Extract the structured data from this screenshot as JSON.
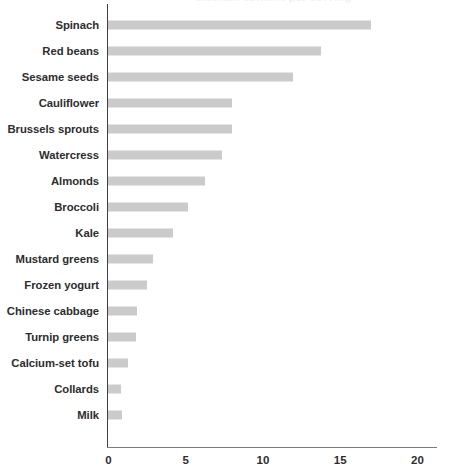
{
  "chart_data": {
    "type": "bar",
    "orientation": "horizontal",
    "title": "Calcium content per serving",
    "xlabel": "",
    "ylabel": "",
    "xlim": [
      0,
      20
    ],
    "xticks": [
      0,
      5,
      10,
      15,
      20
    ],
    "xtick_labels": [
      "0",
      "5",
      "10",
      "15",
      "20"
    ],
    "grid": false,
    "legend": null,
    "bar_color": "#cbcbcb",
    "axis_color": "#3f3f41",
    "label_color": "#2d2d30",
    "categories": [
      "Spinach",
      "Red beans",
      "Sesame seeds",
      "Cauliflower",
      "Brussels sprouts",
      "Watercress",
      "Almonds",
      "Broccoli",
      "Kale",
      "Mustard greens",
      "Frozen yogurt",
      "Chinese cabbage",
      "Turnip greens",
      "Calcium-set tofu",
      "Collards",
      "Milk"
    ],
    "values": [
      17.0,
      13.8,
      12.0,
      8.0,
      8.0,
      7.4,
      6.3,
      5.2,
      4.2,
      2.9,
      2.5,
      1.9,
      1.8,
      1.3,
      0.85,
      0.9
    ]
  }
}
